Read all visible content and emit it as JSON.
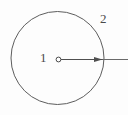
{
  "figure": {
    "type": "technical-line-drawing",
    "background_color": "#fdfdfd",
    "stroke_color": "#5a5a5a",
    "label_color": "#4a4a4a",
    "canvas": {
      "width": 128,
      "height": 115
    },
    "shapes": {
      "circle": {
        "name": "main-circle",
        "center_x": 57.5,
        "center_y": 58,
        "radius": 46.5,
        "stroke_width": 1,
        "fill": "none"
      },
      "center_marker": {
        "name": "center-point",
        "center_x": 58.5,
        "center_y": 59.5,
        "radius": 2.4,
        "stroke_width": 1,
        "fill": "none"
      },
      "radius_arrow": {
        "name": "radius-dimension-arrow",
        "x1": 59,
        "y1": 59.5,
        "x2": 103,
        "y2": 59.5,
        "stroke_width": 1,
        "arrowhead": "right"
      },
      "leader_line": {
        "name": "leader-line",
        "x1": 103,
        "y1": 59.5,
        "x2": 128,
        "y2": 59.5,
        "stroke_width": 1
      }
    },
    "labels": [
      {
        "id": "1",
        "text": "1",
        "meaning": "center-point-callout",
        "x": 40,
        "y": 51
      },
      {
        "id": "2",
        "text": "2",
        "meaning": "circle-outline-callout",
        "x": 100,
        "y": 12
      }
    ]
  }
}
